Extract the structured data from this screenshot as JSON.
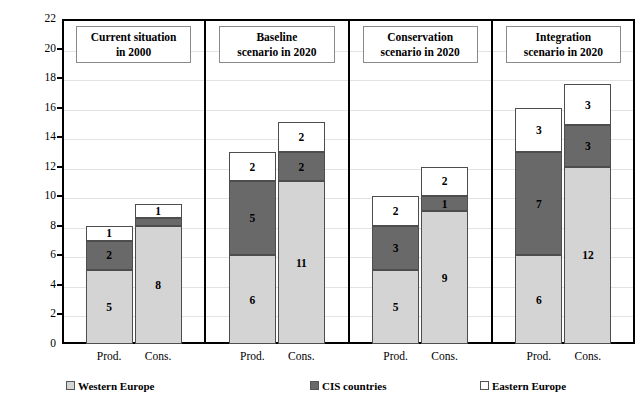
{
  "chart_data": {
    "type": "bar",
    "title": "",
    "subtitle": "",
    "xlabel": "",
    "ylabel": "Amount (in million cubic metres)",
    "ylim": [
      0,
      22
    ],
    "ytick_step": 2,
    "yticks": [
      "0",
      "2",
      "4",
      "6",
      "8",
      "10",
      "12",
      "14",
      "16",
      "18",
      "20",
      "22"
    ],
    "grid": true,
    "stacked": true,
    "legend_position": "bottom",
    "series": [
      {
        "name": "Western Europe",
        "color": "#d4d4d4"
      },
      {
        "name": "CIS countries",
        "color": "#696969"
      },
      {
        "name": "Eastern Europe",
        "color": "#ffffff"
      }
    ],
    "panels": [
      {
        "title_line1": "Current  situation",
        "title_line2": "in 2000",
        "categories": [
          "Prod.",
          "Cons."
        ],
        "bars": [
          {
            "category": "Prod.",
            "total": 7.5,
            "segments": [
              {
                "series": "Western Europe",
                "value": 5,
                "label": "5"
              },
              {
                "series": "CIS countries",
                "value": 2,
                "label": "2"
              },
              {
                "series": "Eastern Europe",
                "value": 1,
                "label": "1"
              }
            ]
          },
          {
            "category": "Cons.",
            "total": 9.4,
            "segments": [
              {
                "series": "Western Europe",
                "value": 8,
                "label": "8"
              },
              {
                "series": "CIS countries",
                "value": 0.5,
                "label": ""
              },
              {
                "series": "Eastern Europe",
                "value": 1,
                "label": "1"
              }
            ]
          }
        ]
      },
      {
        "title_line1": "Baseline",
        "title_line2": "scenario in 2020",
        "categories": [
          "Prod.",
          "Cons."
        ],
        "bars": [
          {
            "category": "Prod.",
            "total": 13,
            "segments": [
              {
                "series": "Western Europe",
                "value": 6,
                "label": "6"
              },
              {
                "series": "CIS countries",
                "value": 5,
                "label": "5"
              },
              {
                "series": "Eastern Europe",
                "value": 2,
                "label": "2"
              }
            ]
          },
          {
            "category": "Cons.",
            "total": 15,
            "segments": [
              {
                "series": "Western Europe",
                "value": 11,
                "label": "11"
              },
              {
                "series": "CIS countries",
                "value": 2,
                "label": "2"
              },
              {
                "series": "Eastern Europe",
                "value": 2,
                "label": "2"
              }
            ]
          }
        ]
      },
      {
        "title_line1": "Conservation",
        "title_line2": "scenario in 2020",
        "categories": [
          "Prod.",
          "Cons."
        ],
        "bars": [
          {
            "category": "Prod.",
            "total": 10,
            "segments": [
              {
                "series": "Western Europe",
                "value": 5,
                "label": "5"
              },
              {
                "series": "CIS countries",
                "value": 3,
                "label": "3"
              },
              {
                "series": "Eastern Europe",
                "value": 2,
                "label": "2"
              }
            ]
          },
          {
            "category": "Cons.",
            "total": 12,
            "segments": [
              {
                "series": "Western Europe",
                "value": 9,
                "label": "9"
              },
              {
                "series": "CIS countries",
                "value": 1,
                "label": "1"
              },
              {
                "series": "Eastern Europe",
                "value": 2,
                "label": "2"
              }
            ]
          }
        ]
      },
      {
        "title_line1": "Integration",
        "title_line2": "scenario in 2020",
        "categories": [
          "Prod.",
          "Cons."
        ],
        "bars": [
          {
            "category": "Prod.",
            "total": 16,
            "segments": [
              {
                "series": "Western Europe",
                "value": 6,
                "label": "6"
              },
              {
                "series": "CIS countries",
                "value": 7,
                "label": "7"
              },
              {
                "series": "Eastern Europe",
                "value": 3,
                "label": "3"
              }
            ]
          },
          {
            "category": "Cons.",
            "total": 17.6,
            "segments": [
              {
                "series": "Western Europe",
                "value": 12,
                "label": "12"
              },
              {
                "series": "CIS countries",
                "value": 2.8,
                "label": "3"
              },
              {
                "series": "Eastern Europe",
                "value": 2.8,
                "label": "3"
              }
            ]
          }
        ]
      }
    ]
  },
  "legend": {
    "items": [
      {
        "label": "Western Europe",
        "color": "#d4d4d4"
      },
      {
        "label": "CIS countries",
        "color": "#696969"
      },
      {
        "label": "Eastern Europe",
        "color": "#ffffff"
      }
    ]
  }
}
